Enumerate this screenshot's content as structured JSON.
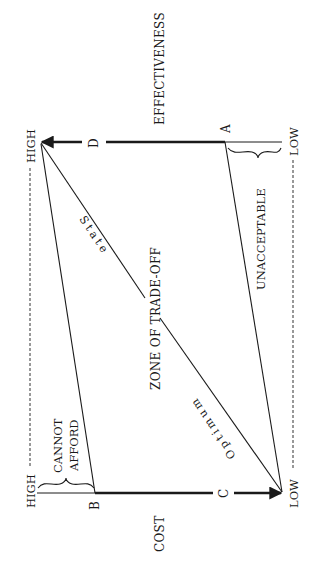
{
  "diagram": {
    "axes": {
      "effectiveness": {
        "label": "EFFECTIVENESS",
        "high": "HIGH",
        "low": "LOW"
      },
      "cost": {
        "label": "COST",
        "high": "HIGH",
        "low": "LOW"
      }
    },
    "points": {
      "a": "A",
      "b": "B",
      "c": "C",
      "d": "D"
    },
    "zones": {
      "cannot_afford_line1": "CANNOT",
      "cannot_afford_line2": "AFFORD",
      "unacceptable": "UNACCEPTABLE",
      "trade_off": "ZONE OF TRADE-OFF"
    },
    "diagonal": {
      "state": "State",
      "optimum": "Optimum"
    },
    "colors": {
      "ink": "#1a1a1a",
      "background": "#ffffff"
    }
  }
}
